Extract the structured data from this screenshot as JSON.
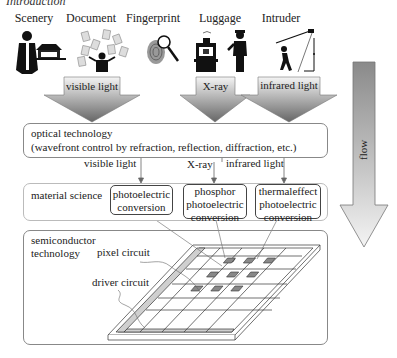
{
  "heading_clipped": "Introduction",
  "sources": [
    {
      "label": "Scenery",
      "icon": "scenery-person-temple-icon"
    },
    {
      "label": "Document",
      "icon": "document-person-icon"
    },
    {
      "label": "Fingerprint",
      "icon": "fingerprint-magnifier-icon"
    },
    {
      "label": "Luggage",
      "icon": "luggage-xray-guard-icon"
    },
    {
      "label": "Intruder",
      "icon": "intruder-sensor-icon"
    }
  ],
  "input_arrows": [
    {
      "label": "visible light"
    },
    {
      "label": "X-ray"
    },
    {
      "label": "infrared light"
    }
  ],
  "optical": {
    "title": "optical technology",
    "subtitle": "(wavefront control by refraction, reflection, diffraction, etc.)"
  },
  "signal_labels": [
    "visible light",
    "X-ray",
    "infrared light"
  ],
  "material": {
    "title": "material science",
    "boxes": [
      {
        "lines": [
          "photoelectric",
          "conversion"
        ]
      },
      {
        "lines": [
          "phosphor",
          "photoelectric",
          "conversion"
        ]
      },
      {
        "lines": [
          "thermaleffect",
          "photoelectric",
          "conversion"
        ]
      }
    ]
  },
  "semiconductor": {
    "title_line1": "semiconductor",
    "title_line2": "technology",
    "pixel_label": "pixel circuit",
    "driver_label": "driver circuit"
  },
  "flow_arrow": {
    "label": "flow"
  },
  "colors": {
    "arrow_top": "#f2f2f2",
    "arrow_bottom": "#6e6e6e",
    "border": "#888888"
  }
}
